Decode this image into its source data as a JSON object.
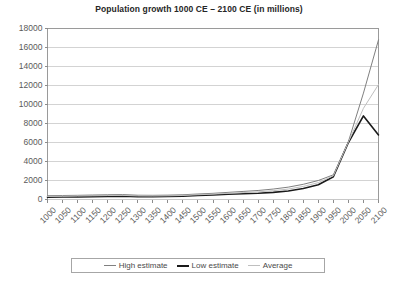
{
  "chart_data": {
    "type": "line",
    "title": "Population growth 1000 CE – 2100 CE (in millions)",
    "xlabel": "",
    "ylabel": "",
    "ylim": [
      0,
      18000
    ],
    "ytick_step": 2000,
    "grid": true,
    "legend_position": "bottom",
    "categories": [
      "1000",
      "1050",
      "1100",
      "1150",
      "1200",
      "1250",
      "1300",
      "1350",
      "1400",
      "1450",
      "1500",
      "1550",
      "1600",
      "1650",
      "1700",
      "1750",
      "1800",
      "1850",
      "1900",
      "1950",
      "2000",
      "2050",
      "2100"
    ],
    "x": [
      1000,
      1050,
      1100,
      1150,
      1200,
      1250,
      1300,
      1350,
      1400,
      1450,
      1500,
      1550,
      1600,
      1650,
      1700,
      1750,
      1800,
      1850,
      1900,
      1950,
      2000,
      2050,
      2100
    ],
    "yticks": [
      "0",
      "2000",
      "4000",
      "6000",
      "8000",
      "10000",
      "12000",
      "14000",
      "16000",
      "18000"
    ],
    "series": [
      {
        "name": "High estimate",
        "color": "#808080",
        "width": 1,
        "values": [
          400,
          420,
          440,
          470,
          500,
          520,
          450,
          440,
          460,
          500,
          580,
          650,
          750,
          850,
          950,
          1100,
          1300,
          1600,
          2000,
          2600,
          6100,
          11200,
          16800
        ]
      },
      {
        "name": "Low estimate",
        "color": "#1a1a1a",
        "width": 1.6,
        "values": [
          250,
          260,
          280,
          300,
          330,
          350,
          300,
          290,
          310,
          350,
          420,
          480,
          550,
          600,
          650,
          750,
          900,
          1150,
          1550,
          2400,
          6000,
          8800,
          6800
        ]
      },
      {
        "name": "Average",
        "color": "#bfbfbf",
        "width": 1,
        "values": [
          320,
          340,
          360,
          385,
          415,
          435,
          375,
          365,
          385,
          425,
          500,
          565,
          650,
          725,
          800,
          925,
          1100,
          1375,
          1775,
          2500,
          6050,
          9600,
          12100
        ]
      }
    ]
  },
  "legend": {
    "entries": [
      {
        "label": "High estimate"
      },
      {
        "label": "Low estimate"
      },
      {
        "label": "Average"
      }
    ]
  }
}
